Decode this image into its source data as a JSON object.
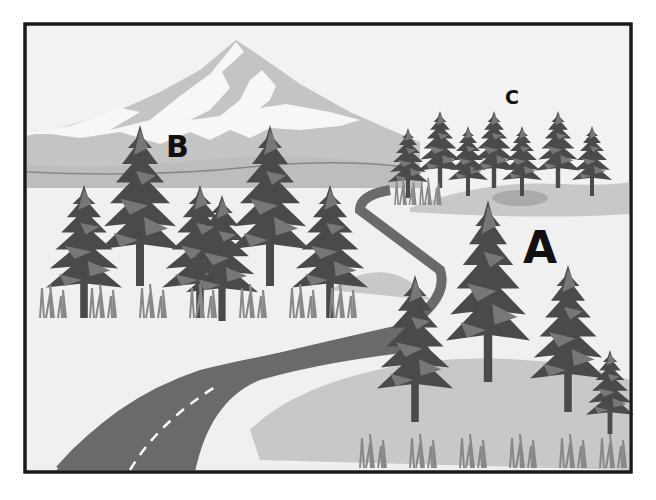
{
  "scene": {
    "description": "Grayscale illustration of a landscape with a snow-capped mountain, three groups of evergreen trees, and a winding road",
    "labels": [
      {
        "id": "A",
        "text": "A",
        "x": 523,
        "y": 228,
        "size": 44
      },
      {
        "id": "B",
        "text": "B",
        "x": 166,
        "y": 134,
        "size": 30
      },
      {
        "id": "C",
        "text": "C",
        "x": 504,
        "y": 90,
        "size": 19
      }
    ],
    "colors": {
      "frame": "#1a1a1a",
      "sky": "#f2f2f2",
      "mountain": "#c4c4c4",
      "snow": "#f7f7f7",
      "far_hills": "#bdbdbd",
      "ground": "#f0f0f0",
      "meadow": "#c8c8c8",
      "tree_dark": "#4a4a4a",
      "tree_mid": "#6e6e6e",
      "road": "#6a6a6a",
      "road_line": "#ffffff"
    }
  }
}
